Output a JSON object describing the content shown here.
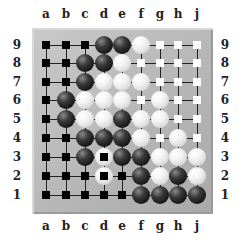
{
  "board": {
    "size": 9,
    "columns": [
      "a",
      "b",
      "c",
      "d",
      "e",
      "f",
      "g",
      "h",
      "j"
    ],
    "rows": [
      "9",
      "8",
      "7",
      "6",
      "5",
      "4",
      "3",
      "2",
      "1"
    ],
    "colors": {
      "board": "#b8b8b8",
      "black": "#111111",
      "white": "#f2f2f2",
      "line": "#222222"
    },
    "legend": {
      "B": "black stone",
      "W": "white stone",
      "b": "black territory marker (square)",
      "w": "white territory marker (square)",
      "X": "white stone marked with black square (dead)"
    },
    "grid": [
      [
        "b",
        "b",
        "b",
        "B",
        "B",
        "W",
        "w",
        "w",
        "w"
      ],
      [
        "b",
        "b",
        "B",
        "B",
        "W",
        "w",
        "w",
        "w",
        "w"
      ],
      [
        "b",
        "b",
        "B",
        "W",
        "W",
        "W",
        "w",
        "w",
        "w"
      ],
      [
        "b",
        "B",
        "W",
        "W",
        "W",
        "w",
        "W",
        "w",
        "w"
      ],
      [
        "b",
        "B",
        "W",
        "W",
        "B",
        "W",
        "W",
        "w",
        "w"
      ],
      [
        "b",
        "b",
        "B",
        "B",
        "B",
        "W",
        "w",
        "W",
        "w"
      ],
      [
        "b",
        "b",
        "B",
        "X",
        "B",
        "B",
        "W",
        "W",
        "W"
      ],
      [
        "b",
        "b",
        "b",
        "X",
        "b",
        "B",
        "W",
        "B",
        "W"
      ],
      [
        "b",
        "b",
        "b",
        "b",
        "b",
        "B",
        "B",
        "B",
        "B"
      ]
    ]
  }
}
